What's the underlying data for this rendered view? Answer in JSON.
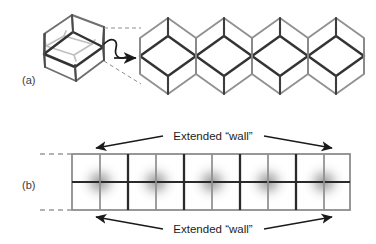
{
  "figure": {
    "type": "scientific-diagram",
    "background_color": "#ffffff",
    "width": 376,
    "height": 244
  },
  "panels": [
    {
      "id": "a",
      "label": "(a)",
      "label_x": 22,
      "label_y": 80,
      "description": "rhombic-unit-cell-and-extended-tessellation-row",
      "elements": {
        "unit_cell": {
          "name": "rhombic-dodecahedron-wireframe",
          "center_x": 74,
          "center_y": 48,
          "front_edge_color": "#3a3a3a",
          "back_edge_color": "#b8b8b8",
          "outline_color": "#6a6a6a"
        },
        "transform_arrow": {
          "name": "squiggle-arrow",
          "color": "#1a1a1a"
        },
        "dashed_guides": {
          "color": "#8a8a8a",
          "count": 2
        },
        "tessellation": {
          "name": "hexagon-rhombus-row",
          "unit_count": 4,
          "hex_outline_color": "#8f8f8f",
          "rhombus_color": "#3a3a3a",
          "start_x": 140,
          "pitch": 56,
          "center_y": 56,
          "hex_radius": 32
        }
      }
    },
    {
      "id": "b",
      "label": "(b)",
      "label_x": 22,
      "label_y": 185,
      "description": "extended-wall-grid-with-density-clouds",
      "elements": {
        "grid": {
          "name": "wall-grid",
          "left": 72,
          "right": 350,
          "top": 154,
          "bottom": 210,
          "rows": 2,
          "columns": 10,
          "thick_line_color": "#2a2a2a",
          "thin_line_color": "#8d8d8d",
          "border_color": "#8d8d8d",
          "cloud_color": "#9a9a9a"
        },
        "dashed_continuations": {
          "color": "#9a9a9a",
          "positions": [
            "top-left",
            "bottom-left"
          ],
          "dash_count": 3
        },
        "annotations": [
          {
            "name": "top-wall-arrow",
            "text": "Extended \"wall\"",
            "text_x": 213,
            "text_y": 139,
            "arrow_color": "#1a1a1a"
          },
          {
            "name": "bottom-wall-arrow",
            "text": "Extended \"wall\"",
            "text_x": 213,
            "text_y": 232,
            "arrow_color": "#1a1a1a"
          }
        ]
      }
    }
  ],
  "labels": {
    "panel_a": "(a)",
    "panel_b": "(b)",
    "extended_wall_top": "Extended “wall”",
    "extended_wall_bottom": "Extended “wall”"
  },
  "colors": {
    "background": "#ffffff",
    "dark_edge": "#3a3a3a",
    "light_edge": "#b8b8b8",
    "mid_edge": "#8f8f8f",
    "text": "#1c1c1c",
    "panel_label": "#3b3b3b",
    "cloud": "#9a9a9a"
  }
}
